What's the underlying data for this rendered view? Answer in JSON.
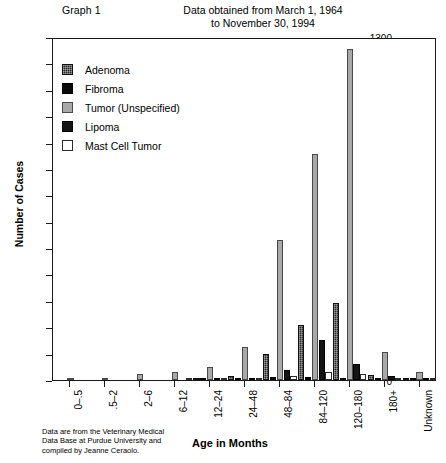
{
  "header": {
    "graph_label": "Graph 1",
    "subtitle_line1": "Data obtained from March 1, 1964",
    "subtitle_line2": "to November 30, 1994"
  },
  "axes": {
    "ylabel": "Number of Cases",
    "xlabel": "Age in Months",
    "y_ticks": [
      "0",
      "100",
      "200",
      "300",
      "400",
      "500",
      "600",
      "700",
      "800",
      "900",
      "1000",
      "1100",
      "1200",
      "1300"
    ]
  },
  "legend": {
    "items": [
      {
        "label": "Adenoma",
        "swatch": "adenoma",
        "color": "#2b2b2b"
      },
      {
        "label": "Fibroma",
        "swatch": "fibroma",
        "color": "#0a0a0a"
      },
      {
        "label": "Tumor  (Unspecified)",
        "swatch": "tumor",
        "color": "#a8a8a8"
      },
      {
        "label": "Lipoma",
        "swatch": "lipoma",
        "color": "#141414"
      },
      {
        "label": "Mast Cell Tumor",
        "swatch": "mast",
        "color": "#ffffff"
      }
    ]
  },
  "footnote": {
    "line1": "Data are from the Veterinary Medical",
    "line2": "Data Base at Purdue University and",
    "line3": "compiled by Jeanne Ceraolo."
  },
  "chart_data": {
    "type": "bar",
    "title": "Graph 1",
    "subtitle": "Data obtained from March 1, 1964 to November 30, 1994",
    "xlabel": "Age in Months",
    "ylabel": "Number of Cases",
    "ylim": [
      0,
      1300
    ],
    "ytick_step": 100,
    "grid": false,
    "legend_position": "upper-left-inside",
    "categories": [
      "0–.5",
      ".5–2",
      "2–6",
      "6–12",
      "12–24",
      "24–48",
      "48–84",
      "84–120",
      "120–180",
      "180+",
      "Unknown"
    ],
    "series": [
      {
        "name": "Adenoma",
        "color": "#2b2b2b",
        "values": [
          0,
          0,
          0,
          0,
          3,
          17,
          100,
          207,
          293,
          18,
          4
        ]
      },
      {
        "name": "Fibroma",
        "color": "#0a0a0a",
        "values": [
          0,
          0,
          0,
          0,
          2,
          4,
          10,
          12,
          8,
          3,
          1
        ]
      },
      {
        "name": "Tumor  (Unspecified)",
        "color": "#a8a8a8",
        "values": [
          6,
          2,
          22,
          30,
          48,
          125,
          530,
          855,
          1255,
          105,
          30
        ]
      },
      {
        "name": "Lipoma",
        "color": "#141414",
        "values": [
          0,
          0,
          0,
          0,
          2,
          5,
          38,
          152,
          60,
          14,
          7
        ]
      },
      {
        "name": "Mast Cell Tumor",
        "color": "#ffffff",
        "values": [
          0,
          0,
          0,
          1,
          3,
          6,
          14,
          30,
          22,
          5,
          2
        ]
      }
    ]
  }
}
